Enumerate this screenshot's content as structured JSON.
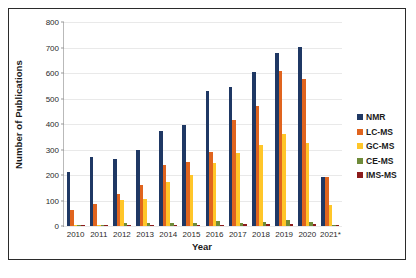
{
  "chart_data": {
    "type": "bar",
    "title": "",
    "xlabel": "Year",
    "ylabel": "Number of Publications",
    "ylim": [
      0,
      800
    ],
    "yticks": [
      0,
      100,
      200,
      300,
      400,
      500,
      600,
      700,
      800
    ],
    "grid": true,
    "legend_position": "right",
    "categories": [
      "2010",
      "2011",
      "2012",
      "2013",
      "2014",
      "2015",
      "2016",
      "2017",
      "2018",
      "2019",
      "2020",
      "2021*"
    ],
    "series": [
      {
        "name": "NMR",
        "color": "#1f3864",
        "values": [
          212,
          271,
          261,
          300,
          373,
          398,
          531,
          547,
          604,
          678,
          703,
          193
        ]
      },
      {
        "name": "LC-MS",
        "color": "#e0641e",
        "values": [
          62,
          88,
          127,
          162,
          241,
          251,
          291,
          417,
          472,
          606,
          578,
          194
        ]
      },
      {
        "name": "GC-MS",
        "color": "#ffc629",
        "values": [
          0,
          0,
          102,
          104,
          171,
          200,
          247,
          285,
          317,
          362,
          327,
          81
        ]
      },
      {
        "name": "CE-MS",
        "color": "#6f8b3a",
        "values": [
          4,
          5,
          13,
          12,
          11,
          10,
          18,
          12,
          14,
          25,
          14,
          3
        ]
      },
      {
        "name": "IMS-MS",
        "color": "#8c1b1b",
        "values": [
          1,
          2,
          2,
          3,
          3,
          4,
          5,
          8,
          7,
          8,
          7,
          2
        ]
      }
    ]
  },
  "caption": {
    "text": ""
  }
}
